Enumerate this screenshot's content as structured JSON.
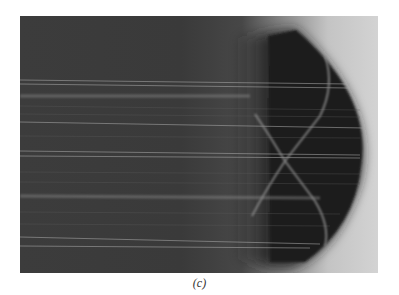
{
  "figure": {
    "caption": "(c)"
  },
  "colors": {
    "page_background": "#ffffff",
    "photo_dark": "#3a3a3a",
    "photo_light": "#d3d3d3",
    "lens": "#1e1e1e",
    "ray": "#9a9a9a"
  }
}
